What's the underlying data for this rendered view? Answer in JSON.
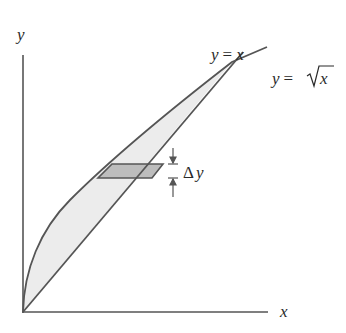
{
  "diagram": {
    "axes": {
      "x_label": "x",
      "y_label": "y"
    },
    "curves": [
      {
        "name": "line",
        "label": "y = x",
        "lhs": "y",
        "eq": "=",
        "rhs": "x"
      },
      {
        "name": "sqrt",
        "label": "y = √x",
        "lhs": "y",
        "eq": "=",
        "rhs": "x",
        "radical": "√"
      }
    ],
    "strip": {
      "label": "Δy",
      "delta": "Δ",
      "var": "y"
    },
    "colors": {
      "stroke": "#555555",
      "region_fill": "#ececec",
      "strip_fill": "#bdbdbd",
      "text": "#2a2a2a"
    }
  }
}
